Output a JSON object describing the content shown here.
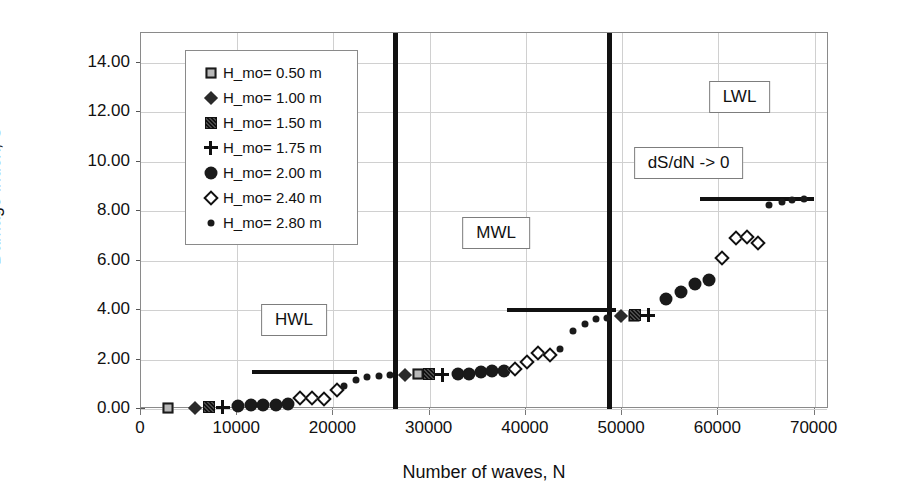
{
  "chart_data": {
    "type": "scatter",
    "title": "",
    "xlabel": "Number of waves, N",
    "ylabel": "Damage index, S",
    "xlim": [
      0,
      71500
    ],
    "ylim": [
      0,
      15.2
    ],
    "xticks": [
      "0",
      "10000",
      "20000",
      "30000",
      "40000",
      "50000",
      "60000",
      "70000"
    ],
    "xtick_values": [
      0,
      10000,
      20000,
      30000,
      40000,
      50000,
      60000,
      70000
    ],
    "yticks": [
      "0.00",
      "2.00",
      "4.00",
      "6.00",
      "8.00",
      "10.00",
      "12.00",
      "14.00"
    ],
    "ytick_values": [
      0,
      2,
      4,
      6,
      8,
      10,
      12,
      14
    ],
    "grid": true,
    "legend_position": "upper-left-inside",
    "series": [
      {
        "name": "H_mo= 0.50 m",
        "marker": "square-light",
        "points": [
          [
            2800,
            0.05
          ],
          [
            28800,
            1.4
          ],
          [
            51200,
            3.75
          ]
        ]
      },
      {
        "name": "H_mo= 1.00 m",
        "marker": "diamond-filled",
        "points": [
          [
            5600,
            0.05
          ],
          [
            27400,
            1.38
          ],
          [
            49900,
            3.75
          ]
        ]
      },
      {
        "name": "H_mo= 1.50 m",
        "marker": "square-dark",
        "points": [
          [
            7100,
            0.08
          ],
          [
            29900,
            1.4
          ],
          [
            51300,
            3.78
          ]
        ]
      },
      {
        "name": "H_mo= 1.75 m",
        "marker": "plus",
        "points": [
          [
            8500,
            0.08
          ],
          [
            31300,
            1.38
          ],
          [
            52700,
            3.78
          ]
        ]
      },
      {
        "name": "H_mo= 2.00 m",
        "marker": "circle-filled",
        "points": [
          [
            10100,
            0.12
          ],
          [
            11400,
            0.15
          ],
          [
            12700,
            0.16
          ],
          [
            14000,
            0.18
          ],
          [
            15300,
            0.2
          ],
          [
            32900,
            1.4
          ],
          [
            34100,
            1.42
          ],
          [
            35300,
            1.48
          ],
          [
            36500,
            1.52
          ],
          [
            37700,
            1.55
          ],
          [
            54600,
            4.45
          ],
          [
            56100,
            4.75
          ],
          [
            57600,
            5.05
          ],
          [
            59000,
            5.2
          ]
        ]
      },
      {
        "name": "H_mo= 2.40 m",
        "marker": "diamond-open",
        "points": [
          [
            16500,
            0.45
          ],
          [
            17800,
            0.45
          ],
          [
            19000,
            0.42
          ],
          [
            20400,
            0.78
          ],
          [
            38900,
            1.62
          ],
          [
            40100,
            1.9
          ],
          [
            41300,
            2.28
          ],
          [
            42500,
            2.18
          ],
          [
            60400,
            6.1
          ],
          [
            61800,
            6.9
          ],
          [
            63000,
            6.95
          ],
          [
            64100,
            6.7
          ]
        ]
      },
      {
        "name": "H_mo= 2.80 m",
        "marker": "dot-small",
        "points": [
          [
            21100,
            0.92
          ],
          [
            22300,
            1.18
          ],
          [
            23500,
            1.3
          ],
          [
            24700,
            1.35
          ],
          [
            25900,
            1.38
          ],
          [
            43500,
            2.42
          ],
          [
            44900,
            3.15
          ],
          [
            46100,
            3.42
          ],
          [
            47300,
            3.62
          ],
          [
            48400,
            3.68
          ],
          [
            65300,
            8.25
          ],
          [
            66600,
            8.35
          ],
          [
            67700,
            8.45
          ],
          [
            68900,
            8.48
          ]
        ]
      }
    ],
    "reference_lines": [
      {
        "label": "dS/dN -> 0",
        "y": 1.5,
        "x_start": 11500,
        "x_end": 22400
      },
      {
        "label": "dS/dN -> 0",
        "y": 4.0,
        "x_start": 38000,
        "x_end": 49400
      },
      {
        "label": "dS/dN -> 0",
        "y": 8.5,
        "x_start": 58100,
        "x_end": 69900
      }
    ],
    "separators": [
      {
        "x": 26400,
        "from_y": 0.0,
        "to_y": 15.2
      },
      {
        "x": 48700,
        "from_y": 0.0,
        "to_y": 15.2
      }
    ],
    "annotations": [
      {
        "text": "HWL",
        "x": 15900,
        "y": 3.6
      },
      {
        "text": "MWL",
        "x": 36900,
        "y": 7.1
      },
      {
        "text": "LWL",
        "x": 62200,
        "y": 12.6
      },
      {
        "text": "dS/dN -> 0",
        "x": 56900,
        "y": 9.95
      }
    ]
  },
  "legend": {
    "items": [
      {
        "label": "H_mo= 0.50 m",
        "marker": "square-light"
      },
      {
        "label": "H_mo= 1.00 m",
        "marker": "diamond-filled"
      },
      {
        "label": "H_mo= 1.50 m",
        "marker": "square-dark"
      },
      {
        "label": "H_mo= 1.75 m",
        "marker": "plus"
      },
      {
        "label": "H_mo= 2.00 m",
        "marker": "circle-filled"
      },
      {
        "label": "H_mo= 2.40 m",
        "marker": "diamond-open"
      },
      {
        "label": "H_mo= 2.80 m",
        "marker": "dot-small"
      }
    ]
  },
  "colors": {
    "marker": "#1a1a1a",
    "grid": "#d0d0d0",
    "axis": "#8a8a8a",
    "text": "#111111",
    "background": "#ffffff"
  }
}
